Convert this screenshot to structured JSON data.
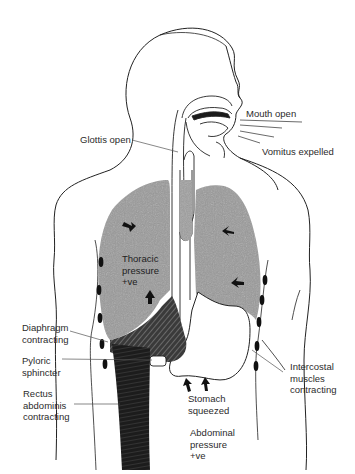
{
  "figure": {
    "colors": {
      "lung_fill": "#9a9a9a",
      "muscle_dark": "#1a1a1a",
      "outline": "#222222",
      "leader_line": "#555555"
    }
  },
  "labels": {
    "mouth_open": "Mouth open",
    "vomitus_expelled": "Vomitus expelled",
    "glottis_open": "Glottis open",
    "thoracic_pressure": "Thoracic\npressure\n+ve",
    "diaphragm_contracting": "Diaphragm\ncontracting",
    "pyloric_sphincter": "Pyloric\nsphincter",
    "rectus_abdominis": "Rectus\nabdominis\ncontracting",
    "intercostal_muscles": "Intercostal\nmuscles\ncontracting",
    "stomach_squeezed": "Stomach\nsqueezed",
    "abdominal_pressure": "Abdominal\npressure\n+ve"
  },
  "icons": {
    "pressure_arrow": "arrow-icon",
    "intercostal_marker": "ellipse-icon"
  }
}
